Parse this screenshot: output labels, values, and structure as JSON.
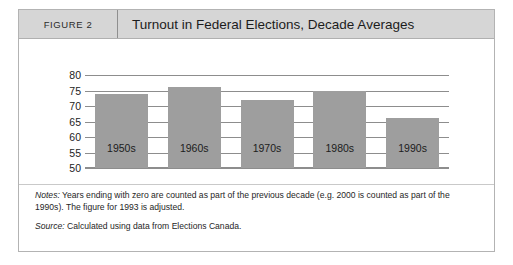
{
  "figure": {
    "label": "FIGURE 2",
    "title": "Turnout in Federal Elections, Decade Averages"
  },
  "notes": {
    "notes_lead": "Notes:",
    "notes_text": " Years ending with zero are counted as part of the previous decade (e.g. 2000 is counted as part of the 1990s). The figure for 1993 is adjusted.",
    "source_lead": "Source:",
    "source_text": " Calculated using data from Elections Canada."
  },
  "colors": {
    "bar_fill": "#9e9e9e",
    "header_bg": "#d6d6d6",
    "grid": "#8d8d8d",
    "border": "#b3b3b3"
  },
  "chart_data": {
    "type": "bar",
    "title": "Turnout in Federal Elections, Decade Averages",
    "xlabel": "",
    "ylabel": "",
    "categories": [
      "1950s",
      "1960s",
      "1970s",
      "1980s",
      "1990s"
    ],
    "values": [
      74,
      76,
      72,
      75,
      66
    ],
    "ylim": [
      50,
      80
    ],
    "yticks": [
      50,
      55,
      60,
      65,
      70,
      75,
      80
    ],
    "yticklabels": [
      "50",
      "55",
      "60",
      "65",
      "70",
      "75",
      "80"
    ],
    "grid": true,
    "legend": false
  }
}
